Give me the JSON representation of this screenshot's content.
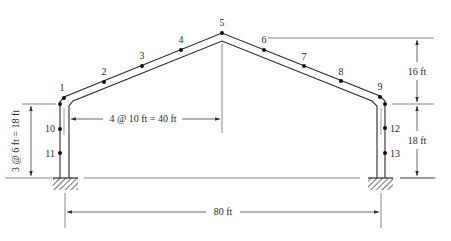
{
  "diagram": {
    "type": "gable frame structural diagram",
    "colors": {
      "line": "#2a2a2a",
      "thin": "#555555",
      "background": "#ffffff"
    },
    "nodes": [
      {
        "id": "1",
        "label": "1"
      },
      {
        "id": "2",
        "label": "2"
      },
      {
        "id": "3",
        "label": "3"
      },
      {
        "id": "4",
        "label": "4"
      },
      {
        "id": "5",
        "label": "5"
      },
      {
        "id": "6",
        "label": "6"
      },
      {
        "id": "7",
        "label": "7"
      },
      {
        "id": "8",
        "label": "8"
      },
      {
        "id": "9",
        "label": "9"
      },
      {
        "id": "10",
        "label": "10"
      },
      {
        "id": "11",
        "label": "11"
      },
      {
        "id": "12",
        "label": "12"
      },
      {
        "id": "13",
        "label": "13"
      }
    ],
    "dimensions": {
      "left_height": "3 @ 6 ft = 18 ft",
      "half_span": "4 @ 10 ft = 40 ft",
      "rise": "16 ft",
      "right_height": "18 ft",
      "total_span": "80 ft"
    },
    "supports": [
      {
        "name": "left-fixed-support",
        "type": "fixed"
      },
      {
        "name": "right-fixed-support",
        "type": "fixed"
      }
    ]
  }
}
